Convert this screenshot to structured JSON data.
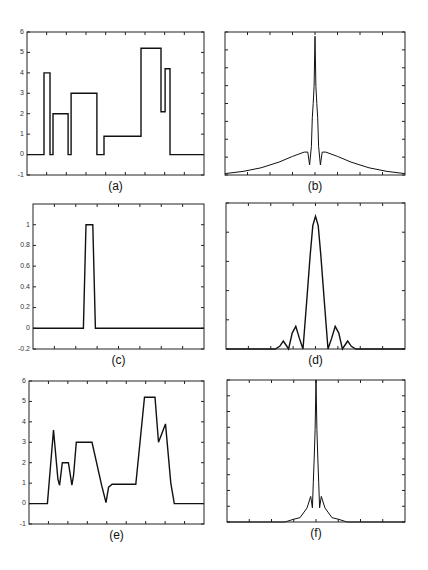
{
  "figure": {
    "width": 428,
    "height": 570,
    "line_color": "#111111",
    "frame_color": "#222222",
    "background": "#ffffff"
  },
  "chart_data": [
    {
      "id": "a",
      "caption": "(a)",
      "type": "line",
      "title": "",
      "xlabel": "",
      "ylabel": "",
      "box": {
        "x": 27,
        "y": 32,
        "w": 177,
        "h": 143
      },
      "xlim": [
        0,
        1
      ],
      "ylim": [
        -1,
        6
      ],
      "yticks": [
        -1,
        0,
        1,
        2,
        3,
        4,
        5,
        6
      ],
      "ytick_labels": [
        "-1",
        "0",
        "1",
        "2",
        "3",
        "4",
        "5",
        "6"
      ],
      "x_minor_ticks": 9,
      "grid": false,
      "step": true,
      "x": [
        0,
        0.096,
        0.096,
        0.13,
        0.13,
        0.147,
        0.147,
        0.232,
        0.232,
        0.249,
        0.249,
        0.395,
        0.395,
        0.435,
        0.435,
        0.644,
        0.644,
        0.757,
        0.757,
        0.78,
        0.78,
        0.808,
        0.808,
        1.0
      ],
      "y": [
        0,
        0,
        4,
        4,
        0,
        0,
        2,
        2,
        0,
        0,
        3,
        3,
        0,
        0,
        0.9,
        0.9,
        5.2,
        5.2,
        2.1,
        2.1,
        4.2,
        4.2,
        0,
        0
      ]
    },
    {
      "id": "b",
      "caption": "(b)",
      "type": "line",
      "title": "",
      "xlabel": "",
      "ylabel": "",
      "box": {
        "x": 225,
        "y": 32,
        "w": 180,
        "h": 143
      },
      "xlim": [
        -1,
        1
      ],
      "ylim": [
        0,
        1
      ],
      "yticks": [
        0,
        0.125,
        0.25,
        0.375,
        0.5,
        0.625,
        0.75,
        0.875,
        1
      ],
      "ytick_labels": [],
      "x_minor_ticks": 8,
      "grid": false,
      "description": "Magnitude spectrum: sharp central spike to ~0.97, secondary spike ~0.62, broad noisy skirt decaying from ~0.15 near centre to ~0.01 at edges",
      "x": [
        -1.0,
        -0.8,
        -0.6,
        -0.4,
        -0.25,
        -0.12,
        -0.08,
        -0.06,
        -0.04,
        -0.03,
        -0.02,
        -0.01,
        0.0,
        0.01,
        0.02,
        0.03,
        0.04,
        0.06,
        0.08,
        0.12,
        0.25,
        0.4,
        0.6,
        0.8,
        1.0
      ],
      "y": [
        0.01,
        0.025,
        0.05,
        0.09,
        0.13,
        0.16,
        0.16,
        0.07,
        0.2,
        0.4,
        0.5,
        0.62,
        0.97,
        0.62,
        0.5,
        0.4,
        0.2,
        0.07,
        0.16,
        0.16,
        0.13,
        0.09,
        0.05,
        0.025,
        0.01
      ]
    },
    {
      "id": "c",
      "caption": "(c)",
      "type": "line",
      "title": "",
      "xlabel": "",
      "ylabel": "",
      "box": {
        "x": 33,
        "y": 204,
        "w": 171,
        "h": 145
      },
      "xlim": [
        0,
        1
      ],
      "ylim": [
        -0.2,
        1.2
      ],
      "yticks": [
        -0.2,
        0,
        0.2,
        0.4,
        0.6,
        0.8,
        1
      ],
      "ytick_labels": [
        "-0.2",
        "0",
        "0.2",
        "0.4",
        "0.6",
        "0.8",
        "1"
      ],
      "x_minor_ticks": 8,
      "grid": false,
      "description": "Narrow smoothing kernel (pulse of height 1)",
      "x": [
        0,
        0.295,
        0.31,
        0.32,
        0.34,
        0.35,
        0.365,
        1.0
      ],
      "y": [
        0,
        0,
        1,
        1,
        1,
        1,
        0,
        0
      ]
    },
    {
      "id": "d",
      "caption": "(d)",
      "type": "line",
      "title": "",
      "xlabel": "",
      "ylabel": "",
      "box": {
        "x": 226,
        "y": 203,
        "w": 179,
        "h": 146
      },
      "xlim": [
        -1,
        1
      ],
      "ylim": [
        0,
        1.1
      ],
      "yticks": [
        0,
        0.22,
        0.44,
        0.66,
        0.88,
        1.1
      ],
      "ytick_labels": [],
      "x_minor_ticks": 8,
      "grid": false,
      "description": "Sinc-like magnitude spectrum of kernel: main lobe peak ~1.0, side lobes ~0.17 and ~0.06",
      "x": [
        -1.0,
        -0.45,
        -0.4,
        -0.36,
        -0.33,
        -0.3,
        -0.26,
        -0.22,
        -0.18,
        -0.14,
        -0.1,
        -0.06,
        -0.03,
        0.0,
        0.03,
        0.06,
        0.1,
        0.14,
        0.18,
        0.22,
        0.26,
        0.3,
        0.33,
        0.36,
        0.4,
        0.45,
        1.0
      ],
      "y": [
        0,
        0,
        0.02,
        0.06,
        0.03,
        0.0,
        0.12,
        0.17,
        0.08,
        0.0,
        0.35,
        0.7,
        0.93,
        1.0,
        0.93,
        0.7,
        0.35,
        0.0,
        0.08,
        0.17,
        0.12,
        0.0,
        0.03,
        0.06,
        0.02,
        0,
        0
      ]
    },
    {
      "id": "e",
      "caption": "(e)",
      "type": "line",
      "title": "",
      "xlabel": "",
      "ylabel": "",
      "box": {
        "x": 29,
        "y": 381,
        "w": 175,
        "h": 143
      },
      "xlim": [
        0,
        1
      ],
      "ylim": [
        -1,
        6
      ],
      "yticks": [
        -1,
        0,
        1,
        2,
        3,
        4,
        5,
        6
      ],
      "ytick_labels": [
        "-1",
        "0",
        "1",
        "2",
        "3",
        "4",
        "5",
        "6"
      ],
      "x_minor_ticks": 9,
      "grid": false,
      "description": "Smoothed version of signal (a)",
      "x": [
        0,
        0.105,
        0.14,
        0.165,
        0.175,
        0.19,
        0.205,
        0.225,
        0.245,
        0.255,
        0.27,
        0.29,
        0.35,
        0.36,
        0.415,
        0.44,
        0.455,
        0.475,
        0.58,
        0.61,
        0.66,
        0.72,
        0.74,
        0.78,
        0.81,
        0.83,
        1.0
      ],
      "y": [
        0,
        0,
        3.6,
        1.2,
        0.9,
        2.0,
        2.0,
        2.0,
        0.9,
        1.4,
        3.0,
        3.0,
        3.0,
        3.0,
        0.9,
        0.05,
        0.8,
        0.95,
        0.95,
        0.95,
        5.2,
        5.2,
        3.0,
        3.9,
        1.0,
        0,
        0
      ]
    },
    {
      "id": "f",
      "caption": "(f)",
      "type": "line",
      "title": "",
      "xlabel": "",
      "ylabel": "",
      "box": {
        "x": 227,
        "y": 380,
        "w": 178,
        "h": 142
      },
      "xlim": [
        -1,
        1
      ],
      "ylim": [
        0,
        1
      ],
      "yticks": [
        0,
        0.111,
        0.222,
        0.333,
        0.444,
        0.556,
        0.667,
        0.778,
        0.889,
        1
      ],
      "ytick_labels": [],
      "x_minor_ticks": 8,
      "grid": false,
      "description": "Magnitude spectrum of smoothed signal: central spike reaching top, secondary ~0.65, narrow skirt, near-zero beyond |x|>0.3",
      "x": [
        -1.0,
        -0.35,
        -0.25,
        -0.18,
        -0.1,
        -0.06,
        -0.04,
        -0.03,
        -0.02,
        -0.01,
        0.0,
        0.01,
        0.02,
        0.03,
        0.04,
        0.06,
        0.1,
        0.18,
        0.25,
        0.35,
        1.0
      ],
      "y": [
        0.0,
        0.0,
        0.02,
        0.03,
        0.1,
        0.18,
        0.1,
        0.28,
        0.45,
        0.65,
        1.0,
        0.65,
        0.45,
        0.28,
        0.1,
        0.18,
        0.1,
        0.03,
        0.02,
        0.0,
        0.0
      ]
    }
  ]
}
